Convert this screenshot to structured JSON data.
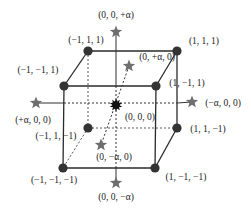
{
  "diagram": {
    "type": "central-composite-design-cube",
    "colors": {
      "edge": "#2a2a2a",
      "dot": "#333333",
      "star": "#6e6e6e",
      "center": "#111111",
      "text": "#222222"
    },
    "corner_points": [
      {
        "id": "c-m1-p1-p1",
        "label": "(−1, 1, 1)",
        "x": 88,
        "y": 51,
        "lx": 86,
        "ly": 43,
        "anchor": "middle"
      },
      {
        "id": "c-p1-p1-p1",
        "label": "(1, 1, 1)",
        "x": 177,
        "y": 51,
        "lx": 204,
        "ly": 44,
        "anchor": "middle"
      },
      {
        "id": "c-m1-m1-p1",
        "label": "(−1, −1, 1)",
        "x": 64,
        "y": 86,
        "lx": 38,
        "ly": 73,
        "anchor": "middle"
      },
      {
        "id": "c-p1-m1-p1",
        "label": "(1, −1, 1)",
        "x": 156,
        "y": 86,
        "lx": 187,
        "ly": 86,
        "anchor": "middle"
      },
      {
        "id": "c-m1-p1-m1",
        "label": "(−1, 1, −1)",
        "x": 88,
        "y": 128,
        "lx": 56,
        "ly": 139,
        "anchor": "middle"
      },
      {
        "id": "c-p1-p1-m1",
        "label": "(1, 1, −1)",
        "x": 177,
        "y": 128,
        "lx": 208,
        "ly": 132,
        "anchor": "middle"
      },
      {
        "id": "c-m1-m1-m1",
        "label": "(−1, −1, −1)",
        "x": 63,
        "y": 168,
        "lx": 54,
        "ly": 183,
        "anchor": "middle"
      },
      {
        "id": "c-p1-m1-m1",
        "label": "(1, −1, −1)",
        "x": 155,
        "y": 168,
        "lx": 186,
        "ly": 180,
        "anchor": "middle"
      }
    ],
    "axial_points": [
      {
        "id": "a-z-plus",
        "label": "(0, 0, +α)",
        "x": 116,
        "y": 32,
        "lx": 116,
        "ly": 18,
        "anchor": "middle"
      },
      {
        "id": "a-y-plus",
        "label": "(0, +α, 0)",
        "x": 129,
        "y": 66,
        "lx": 157,
        "ly": 60,
        "anchor": "middle"
      },
      {
        "id": "a-x-plus",
        "label": "(+α, 0, 0)",
        "x": 36,
        "y": 103,
        "lx": 33,
        "ly": 123,
        "anchor": "middle"
      },
      {
        "id": "a-x-minus",
        "label": "(−α, 0, 0)",
        "x": 192,
        "y": 102,
        "lx": 223,
        "ly": 106,
        "anchor": "middle"
      },
      {
        "id": "a-y-minus",
        "label": "(0, −α, 0)",
        "x": 101,
        "y": 145,
        "lx": 114,
        "ly": 160,
        "anchor": "middle"
      },
      {
        "id": "a-z-minus",
        "label": "(0, 0, −α)",
        "x": 116,
        "y": 183,
        "lx": 116,
        "ly": 200,
        "anchor": "middle"
      }
    ],
    "center_point": {
      "id": "center",
      "label": "(0, 0, 0)",
      "x": 116,
      "y": 105,
      "lx": 140,
      "ly": 120,
      "anchor": "middle"
    }
  }
}
